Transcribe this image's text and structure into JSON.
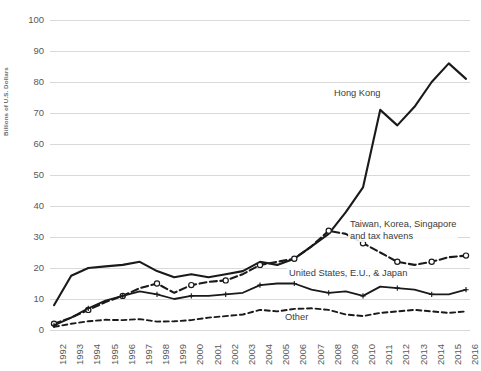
{
  "chart_data": {
    "type": "line",
    "title": "",
    "subtitle": "",
    "xlabel": "",
    "ylabel": "Billions of U.S. Dollars",
    "ylim": [
      0,
      100
    ],
    "ytick_step": 10,
    "yticks": [
      "100",
      "90",
      "80",
      "70",
      "60",
      "50",
      "40",
      "30",
      "20",
      "10",
      "0"
    ],
    "grid": true,
    "legend_position": "inline-annotations",
    "x": [
      "1992",
      "1993",
      "1994",
      "1995",
      "1996",
      "1997",
      "1998",
      "1999",
      "2000",
      "2001",
      "2002",
      "2003",
      "2004",
      "2005",
      "2006",
      "2007",
      "2008",
      "2009",
      "2010",
      "2011",
      "2012",
      "2013",
      "2014",
      "2015",
      "2016"
    ],
    "series": [
      {
        "name": "Hong Kong",
        "style": "solid-thick",
        "color": "#1a1a1a",
        "marker": "none",
        "values": [
          8,
          17.5,
          20,
          20.5,
          21,
          22,
          19,
          17,
          18,
          17,
          18,
          19,
          22,
          21,
          23,
          27,
          31,
          38,
          46,
          71,
          66,
          72,
          80,
          86,
          81
        ]
      },
      {
        "name": "Taiwan, Korea, Singapore and tax havens",
        "style": "dashed-circle",
        "color": "#1a1a1a",
        "marker": "circle-open",
        "values": [
          2,
          4,
          6.5,
          9,
          11,
          13.5,
          15,
          12,
          14.5,
          15.5,
          16,
          18,
          21,
          22,
          23,
          27,
          32,
          31,
          28,
          25,
          22,
          21,
          22,
          23.5,
          24
        ]
      },
      {
        "name": "United States, E.U., & Japan",
        "style": "solid-cross",
        "color": "#1a1a1a",
        "marker": "plus",
        "values": [
          1.5,
          4,
          7,
          9.5,
          11,
          12.5,
          11.5,
          10,
          11,
          11,
          11.5,
          12,
          14.5,
          15,
          15,
          13,
          12,
          12.5,
          11,
          14,
          13.5,
          13,
          11.5,
          11.5,
          13
        ]
      },
      {
        "name": "Other",
        "style": "dashed",
        "color": "#1a1a1a",
        "marker": "none",
        "values": [
          1,
          2,
          2.8,
          3.3,
          3.2,
          3.5,
          2.7,
          2.8,
          3.2,
          4,
          4.5,
          5,
          6.5,
          6,
          6.8,
          7,
          6.5,
          5,
          4.5,
          5.5,
          6,
          6.5,
          6,
          5.5,
          6
        ]
      }
    ],
    "annotations": [
      {
        "name": "hong-kong-label",
        "text": "Hong Kong"
      },
      {
        "name": "taiwan-label-line1",
        "text": "Taiwan, Korea, Singapore"
      },
      {
        "name": "taiwan-label-line2",
        "text": "and tax havens"
      },
      {
        "name": "us-eu-japan-label",
        "text": "United States, E.U., & Japan"
      },
      {
        "name": "other-label",
        "text": "Other"
      }
    ],
    "colors": {
      "line": "#1a1a1a",
      "gridline": "#d9d9d9",
      "tick_text": "#595959",
      "annotation_text": "#3b3b3b",
      "background": "#ffffff"
    }
  }
}
